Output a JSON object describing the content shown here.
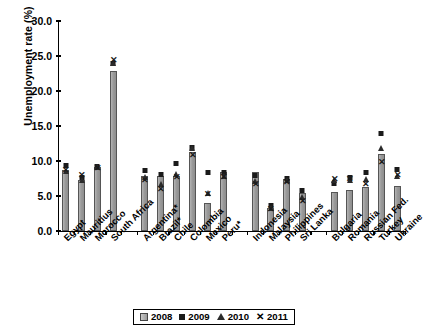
{
  "chart_data": {
    "type": "bar",
    "title": "",
    "xlabel": "",
    "ylabel": "Unemployment rate (%)",
    "ylim": [
      0,
      30
    ],
    "ytick_labels": [
      "0.0",
      "5.0",
      "10.0",
      "15.0",
      "20.0",
      "25.0",
      "30.0"
    ],
    "ytick_values": [
      0,
      5,
      10,
      15,
      20,
      25,
      30
    ],
    "grid": false,
    "legend_position": "bottom-center",
    "legend": [
      "2008",
      "2009",
      "2010",
      "2011"
    ],
    "series": [
      {
        "name": "2008",
        "marker": "bar",
        "values": [
          8.7,
          7.3,
          9.1,
          22.9,
          null,
          7.9,
          7.8,
          7.8,
          11.3,
          4.0,
          8.4,
          null,
          8.4,
          3.3,
          7.4,
          5.4,
          null,
          5.6,
          5.8,
          6.3,
          11.0,
          6.4
        ]
      },
      {
        "name": "2009",
        "marker": "square",
        "values": [
          9.4,
          7.7,
          9.2,
          23.9,
          null,
          8.6,
          8.1,
          9.6,
          12.0,
          8.4,
          8.4,
          null,
          7.9,
          3.7,
          7.5,
          5.8,
          null,
          6.8,
          7.6,
          8.4,
          14.0,
          8.8
        ]
      },
      {
        "name": "2010",
        "marker": "triangle",
        "values": [
          8.6,
          7.3,
          9.1,
          24.0,
          null,
          7.7,
          6.7,
          8.1,
          11.8,
          5.4,
          7.9,
          null,
          7.1,
          3.3,
          7.3,
          4.9,
          null,
          7.3,
          7.3,
          7.5,
          11.9,
          7.9
        ]
      },
      {
        "name": "2011",
        "marker": "cross",
        "values": [
          8.7,
          7.9,
          8.9,
          24.4,
          null,
          7.2,
          6.0,
          7.7,
          10.8,
          5.2,
          7.7,
          null,
          6.6,
          3.1,
          7.0,
          4.2,
          null,
          7.3,
          7.4,
          6.6,
          9.8,
          8.0
        ]
      }
    ],
    "categories": [
      {
        "label": "Egypt",
        "index": 0
      },
      {
        "label": "Mauritius",
        "index": 1
      },
      {
        "label": "Morocco",
        "index": 2
      },
      {
        "label": "South Africa",
        "index": 3
      },
      {
        "label": "",
        "index": 4
      },
      {
        "label": "Argentina*",
        "index": 5
      },
      {
        "label": "Brazil*",
        "index": 6
      },
      {
        "label": "Chile",
        "index": 7
      },
      {
        "label": "Colombia",
        "index": 8
      },
      {
        "label": "Mexico",
        "index": 9
      },
      {
        "label": "Peru*",
        "index": 10
      },
      {
        "label": "",
        "index": 11
      },
      {
        "label": "Indonesia",
        "index": 12
      },
      {
        "label": "Malaysia",
        "index": 13
      },
      {
        "label": "Philippines",
        "index": 14
      },
      {
        "label": "Sri Lanka",
        "index": 15
      },
      {
        "label": "",
        "index": 16
      },
      {
        "label": "Bulgaria",
        "index": 17
      },
      {
        "label": "Romania",
        "index": 18
      },
      {
        "label": "Russian Fed.",
        "index": 19
      },
      {
        "label": "Turkey",
        "index": 20
      },
      {
        "label": "Ukraine",
        "index": 21
      }
    ]
  },
  "colors": {
    "bar_fill": "#9c9c9c",
    "bar_edge": "#555555",
    "marker": "#1a1a1a",
    "axis": "#000000",
    "background": "#ffffff"
  }
}
